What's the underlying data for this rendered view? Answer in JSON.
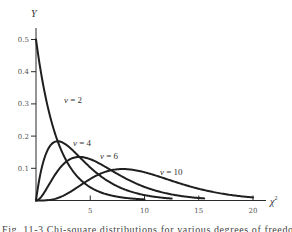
{
  "chart_data": {
    "type": "line",
    "title": "",
    "xlabel": "χ²",
    "ylabel": "Y",
    "xlim": [
      0,
      21
    ],
    "ylim": [
      0,
      0.5
    ],
    "grid": false,
    "legend": "inline labels",
    "x_ticks": [
      5,
      10,
      15,
      20
    ],
    "y_ticks": [
      0.1,
      0.2,
      0.3,
      0.4,
      0.5
    ],
    "y_tick_labels": [
      "0.1",
      "0.2",
      "0.3",
      "0.4",
      "0.5"
    ],
    "x_tick_labels": [
      "5",
      "10",
      "15",
      "20"
    ],
    "series": [
      {
        "name": "ν = 2",
        "df": 2,
        "x_end": 10.0,
        "peak_x": 0,
        "peak_y": 0.5,
        "x": [
          0,
          1,
          2,
          3,
          4,
          5,
          6,
          8,
          10
        ],
        "values": [
          0.5,
          0.303,
          0.184,
          0.112,
          0.068,
          0.041,
          0.025,
          0.009,
          0.003
        ]
      },
      {
        "name": "ν = 4",
        "df": 4,
        "x_end": 12.5,
        "peak_x": 2,
        "peak_y": 0.184,
        "x": [
          0,
          1,
          2,
          3,
          4,
          6,
          8,
          10,
          12.5
        ],
        "values": [
          0,
          0.152,
          0.184,
          0.167,
          0.135,
          0.075,
          0.037,
          0.017,
          0.006
        ]
      },
      {
        "name": "ν = 6",
        "df": 6,
        "x_end": 15.5,
        "peak_x": 4,
        "peak_y": 0.135,
        "x": [
          0,
          2,
          4,
          6,
          8,
          10,
          12,
          15.5
        ],
        "values": [
          0,
          0.092,
          0.135,
          0.112,
          0.073,
          0.042,
          0.022,
          0.006
        ]
      },
      {
        "name": "ν = 10",
        "df": 10,
        "x_end": 20.0,
        "peak_x": 8,
        "peak_y": 0.098,
        "x": [
          0,
          2,
          4,
          6,
          8,
          10,
          12,
          14,
          16,
          20
        ],
        "values": [
          0,
          0.008,
          0.045,
          0.084,
          0.098,
          0.088,
          0.067,
          0.045,
          0.028,
          0.009
        ]
      }
    ],
    "labels": [
      {
        "text": "ν = 2",
        "series": 0,
        "px": 64,
        "py": 103
      },
      {
        "text": "ν = 4",
        "series": 1,
        "px": 73,
        "py": 146
      },
      {
        "text": "ν = 6",
        "series": 2,
        "px": 100,
        "py": 159
      },
      {
        "text": "ν = 10",
        "series": 3,
        "px": 160,
        "py": 175
      }
    ],
    "caption": "Fig. 11-3   Chi-square distributions for various degrees of freedom"
  },
  "axes": {
    "y_title": "Y",
    "x_title_base": "χ",
    "x_title_sup": "2"
  }
}
